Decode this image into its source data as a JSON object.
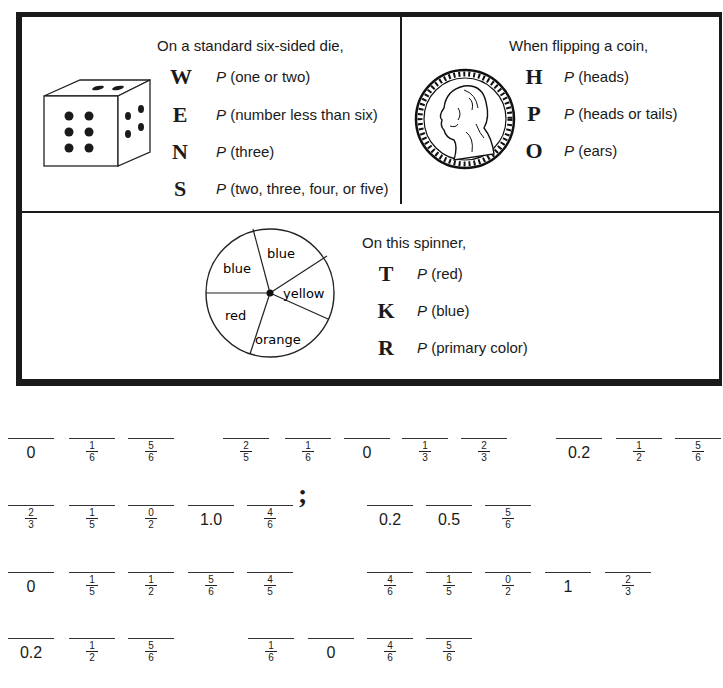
{
  "die_panel": {
    "header": "On a standard six-sided die,",
    "items": [
      {
        "letter": "W",
        "p": "P",
        "text": " (one or two)"
      },
      {
        "letter": "E",
        "p": "P",
        "text": " (number less than six)"
      },
      {
        "letter": "N",
        "p": "P",
        "text": " (three)"
      },
      {
        "letter": "S",
        "p": "P",
        "text": " (two, three, four, or five)"
      }
    ],
    "icon": "die-icon"
  },
  "coin_panel": {
    "header": "When flipping a coin,",
    "items": [
      {
        "letter": "H",
        "p": "P",
        "text": " (heads)"
      },
      {
        "letter": "P",
        "p": "P",
        "text": " (heads or tails)"
      },
      {
        "letter": "O",
        "p": "P",
        "text": " (ears)"
      }
    ],
    "icon": "coin-icon"
  },
  "spinner_panel": {
    "header": "On this spinner,",
    "sections": [
      "blue",
      "blue",
      "yellow",
      "orange",
      "red"
    ],
    "items": [
      {
        "letter": "T",
        "p": "P",
        "text": " (red)"
      },
      {
        "letter": "K",
        "p": "P",
        "text": " (blue)"
      },
      {
        "letter": "R",
        "p": "P",
        "text": " (primary color)"
      }
    ]
  },
  "answer_rows": [
    {
      "blanks": [
        "0",
        "1/6",
        "5/6",
        "2/5",
        "1/6",
        "0",
        "1/3",
        "2/3",
        "0.2",
        "1/2",
        "5/6"
      ]
    },
    {
      "blanks": [
        "2/3",
        "1/5",
        "0/2",
        "1.0",
        "4/6",
        "0.2",
        "0.5",
        "5/6"
      ],
      "punctuation": ";"
    },
    {
      "blanks": [
        "0",
        "1/5",
        "1/2",
        "5/6",
        "4/5",
        "4/6",
        "1/5",
        "0/2",
        "1",
        "2/3"
      ]
    },
    {
      "blanks": [
        "0.2",
        "1/2",
        "5/6",
        "1/6",
        "0",
        "4/6",
        "5/6"
      ]
    }
  ]
}
